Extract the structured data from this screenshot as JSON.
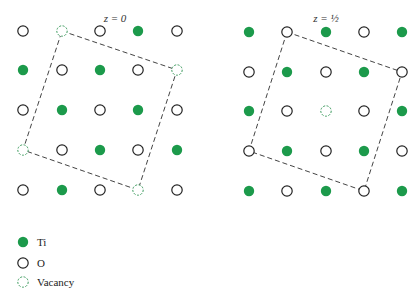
{
  "colors": {
    "ti": "#1c9a4b",
    "o_stroke": "#222222",
    "vacancy_stroke": "#3a9a5c",
    "cell_line": "#444444"
  },
  "panels": [
    {
      "title": "z = 0",
      "title_pos": [
        115,
        22
      ],
      "cols": [
        23,
        62,
        100,
        138,
        177
      ],
      "rows": [
        31,
        70,
        110,
        150,
        190
      ],
      "grid": [
        [
          "O",
          "V",
          "O",
          "Ti",
          "O"
        ],
        [
          "Ti",
          "O",
          "Ti",
          "O",
          "V"
        ],
        [
          "O",
          "Ti",
          "O",
          "Ti",
          "O"
        ],
        [
          "V",
          "O",
          "Ti",
          "O",
          "Ti"
        ],
        [
          "O",
          "Ti",
          "O",
          "V",
          "O"
        ]
      ],
      "cell": [
        [
          62,
          31
        ],
        [
          177,
          70
        ],
        [
          138,
          190
        ],
        [
          23,
          150
        ]
      ]
    },
    {
      "title": "z = ½",
      "title_pos": [
        326,
        22
      ],
      "cols": [
        249,
        287,
        326,
        364,
        402
      ],
      "rows": [
        32,
        72,
        111,
        151,
        191
      ],
      "grid": [
        [
          "Ti",
          "O",
          "Ti",
          "O",
          "Ti"
        ],
        [
          "O",
          "Ti",
          "O",
          "Ti",
          "O"
        ],
        [
          "Ti",
          "O",
          "V",
          "O",
          "Ti"
        ],
        [
          "O",
          "Ti",
          "O",
          "Ti",
          "O"
        ],
        [
          "Ti",
          "O",
          "Ti",
          "O",
          "Ti"
        ]
      ],
      "cell": [
        [
          287,
          32
        ],
        [
          402,
          72
        ],
        [
          364,
          191
        ],
        [
          249,
          151
        ]
      ]
    }
  ],
  "legend": [
    {
      "type": "Ti",
      "label": "Ti",
      "y": 242
    },
    {
      "type": "O",
      "label": "O",
      "y": 263
    },
    {
      "type": "V",
      "label": "Vacancy",
      "y": 282
    }
  ]
}
